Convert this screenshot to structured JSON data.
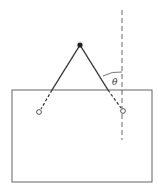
{
  "diagram": {
    "labels": {
      "angle": "θ"
    },
    "colors": {
      "line": "#333333",
      "background": "#ffffff"
    },
    "elements": {
      "plate": {
        "x": 12,
        "y": 90,
        "width": 140,
        "height": 92
      },
      "apex": {
        "x": 80,
        "y": 45
      },
      "left_attachment": {
        "x": 39,
        "y": 112
      },
      "right_attachment": {
        "x": 123,
        "y": 111
      },
      "vertical_reference": {
        "x": 122,
        "y1": 10,
        "y2": 140
      }
    }
  }
}
